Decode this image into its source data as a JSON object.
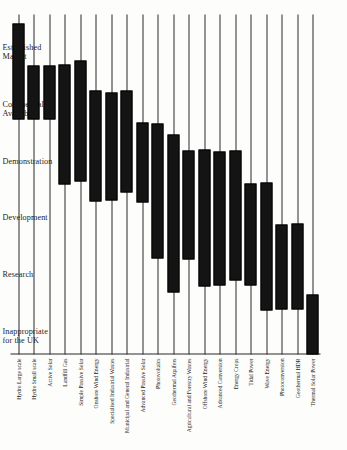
{
  "chart_data": {
    "type": "bar",
    "title": "",
    "subtitle": "",
    "xlabel": "",
    "ylabel": "",
    "orientation": "rotated-90",
    "grid": false,
    "legend": "none",
    "stage_axis": {
      "name": "Stage of development",
      "ticks": [
        "Inappropriate for the UK",
        "Research",
        "Development",
        "Demonstration",
        "Commercially Available",
        "Established Market"
      ],
      "range": [
        0,
        6
      ]
    },
    "categories": [
      "Hydro Large scale",
      "Hydro Small scale",
      "Active Solar",
      "Landfill Gas",
      "Simple Passive Solar",
      "Onshore Wind Energy",
      "Specialised Industrial Wastes",
      "Municipal and General Industrial",
      "Advanced Passive Solar",
      "Photovoltaics",
      "Geothermal Aquifers",
      "Agricultural and Forestry Wastes",
      "Offshore Wind Energy",
      "Advanced Conversion",
      "Energy Crops",
      "Tidal Power",
      "Wave Energy",
      "Photoconversion",
      "Geothermal HDR",
      "Thermal Solar Power"
    ],
    "ranges": [
      {
        "category": "Hydro Large scale",
        "start": 4.15,
        "end": 5.85
      },
      {
        "category": "Hydro Small scale",
        "start": 4.15,
        "end": 5.1
      },
      {
        "category": "Active Solar",
        "start": 4.15,
        "end": 5.1
      },
      {
        "category": "Landfill Gas",
        "start": 3.0,
        "end": 5.12
      },
      {
        "category": "Simple Passive Solar",
        "start": 3.05,
        "end": 5.18
      },
      {
        "category": "Onshore Wind Energy",
        "start": 2.7,
        "end": 4.65
      },
      {
        "category": "Specialised Industrial Wastes",
        "start": 2.72,
        "end": 4.62
      },
      {
        "category": "Municipal and General Industrial",
        "start": 2.85,
        "end": 4.66
      },
      {
        "category": "Advanced Passive Solar",
        "start": 2.68,
        "end": 4.1
      },
      {
        "category": "Photovoltaics",
        "start": 1.7,
        "end": 4.08
      },
      {
        "category": "Geothermal Aquifers",
        "start": 1.1,
        "end": 3.88
      },
      {
        "category": "Agricultural and Forestry Wastes",
        "start": 1.68,
        "end": 3.6
      },
      {
        "category": "Offshore Wind Energy",
        "start": 1.2,
        "end": 3.62
      },
      {
        "category": "Advanced Conversion",
        "start": 1.22,
        "end": 3.58
      },
      {
        "category": "Energy Crops",
        "start": 1.3,
        "end": 3.6
      },
      {
        "category": "Tidal Power",
        "start": 1.22,
        "end": 3.02
      },
      {
        "category": "Wave Energy",
        "start": 0.78,
        "end": 3.03
      },
      {
        "category": "Photoconversion",
        "start": 0.8,
        "end": 2.3
      },
      {
        "category": "Geothermal HDR",
        "start": 0.8,
        "end": 2.32
      },
      {
        "category": "Thermal Solar Power",
        "start": 0.0,
        "end": 1.05
      }
    ]
  }
}
